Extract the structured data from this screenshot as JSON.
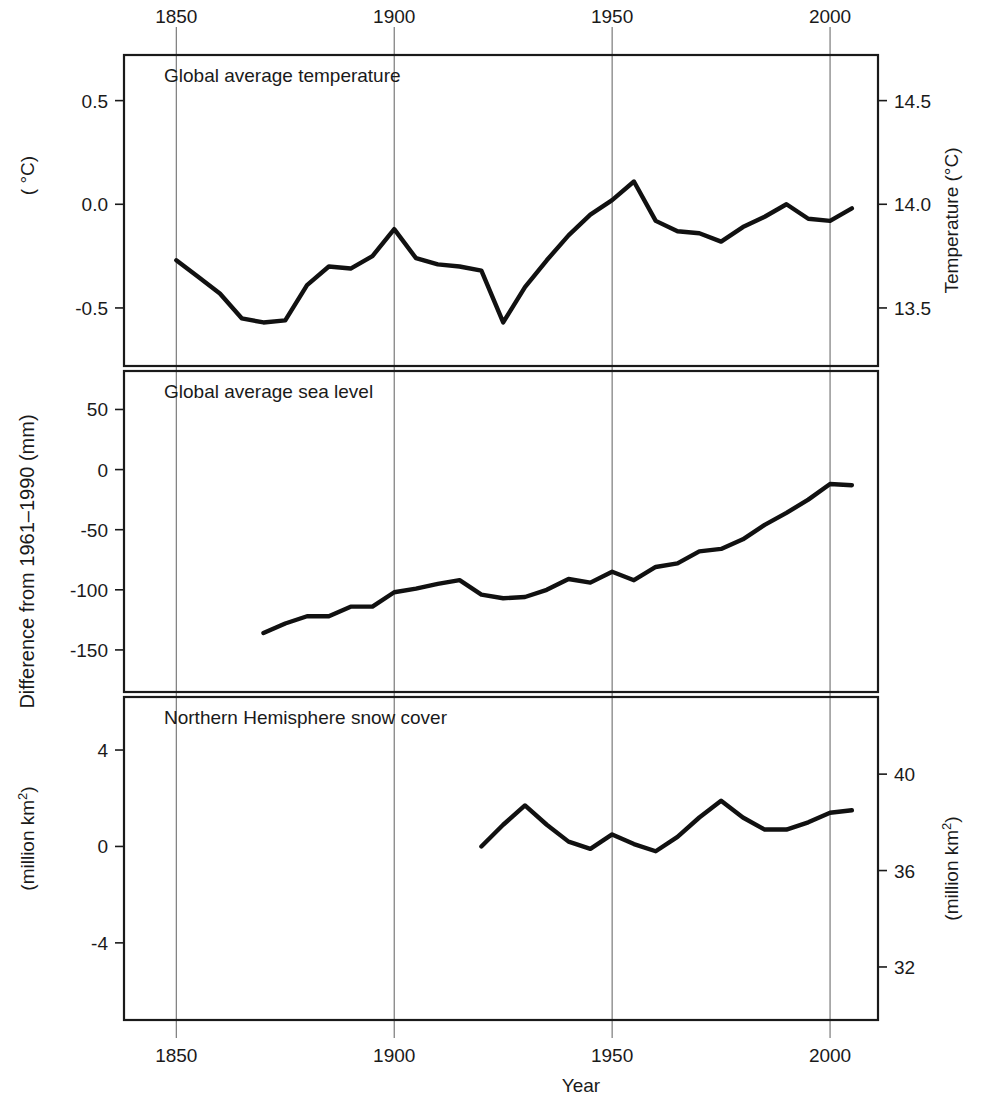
{
  "figure": {
    "xlabel": "Year",
    "x_ticks": [
      1850,
      1900,
      1950,
      2000
    ],
    "x_range": [
      1838,
      2011
    ],
    "left_axis_group_label": "Difference from 1961–1990 (mm)"
  },
  "panels": [
    {
      "id": "temperature",
      "title": "Global average temperature",
      "left_axis_label": "( °C)",
      "left_ticks": [
        "0.5",
        "0.0",
        "-0.5"
      ],
      "left_tick_values": [
        0.5,
        0.0,
        -0.5
      ],
      "right_axis_label": "Temperature  (°C)",
      "right_ticks": [
        "14.5",
        "14.0",
        "13.5"
      ],
      "right_tick_values": [
        0.5,
        0.0,
        -0.5
      ],
      "ylim": [
        -0.78,
        0.72
      ]
    },
    {
      "id": "sea-level",
      "title": "Global average sea level",
      "left_axis_label": "Difference from 1961–1990 (mm)",
      "left_ticks": [
        "50",
        "0",
        "-50",
        "-100",
        "-150"
      ],
      "left_tick_values": [
        50,
        0,
        -50,
        -100,
        -150
      ],
      "right_axis_label": "",
      "right_ticks": [],
      "ylim": [
        -185,
        82
      ]
    },
    {
      "id": "snow-cover",
      "title": "Northern Hemisphere snow cover",
      "left_axis_label": "(million km²)",
      "left_ticks": [
        "4",
        "0",
        "-4"
      ],
      "left_tick_values": [
        4,
        0,
        -4
      ],
      "right_axis_label": "(million km²)",
      "right_ticks": [
        "40",
        "36",
        "32"
      ],
      "right_tick_values": [
        3.0,
        -1.0,
        -5.0
      ],
      "ylim": [
        -7.2,
        6.2
      ]
    }
  ],
  "chart_data": [
    {
      "type": "line",
      "id": "temperature",
      "title": "Global average temperature",
      "xlabel": "Year",
      "ylabel": "( °C)",
      "y2label": "Temperature  (°C)",
      "xlim": [
        1838,
        2011
      ],
      "ylim": [
        -0.78,
        0.72
      ],
      "y2lim": [
        13.22,
        14.72
      ],
      "xticks": [
        1850,
        1900,
        1950,
        2000
      ],
      "yticks": [
        -0.5,
        0.0,
        0.5
      ],
      "y2ticks": [
        13.5,
        14.0,
        14.5
      ],
      "grid": "vertical-only",
      "legend": "none",
      "units": "degrees Celsius anomaly vs 1961-1990",
      "x": [
        1850,
        1855,
        1860,
        1865,
        1870,
        1875,
        1880,
        1885,
        1890,
        1895,
        1900,
        1905,
        1910,
        1915,
        1920,
        1925,
        1930,
        1935,
        1940,
        1945,
        1950,
        1955,
        1960,
        1965,
        1970,
        1975,
        1980,
        1985,
        1990,
        1995,
        2000,
        2005
      ],
      "values": [
        -0.27,
        -0.35,
        -0.43,
        -0.55,
        -0.57,
        -0.56,
        -0.39,
        -0.3,
        -0.31,
        -0.25,
        -0.12,
        -0.26,
        -0.29,
        -0.3,
        -0.32,
        -0.57,
        -0.4,
        -0.27,
        -0.15,
        -0.05,
        0.02,
        0.11,
        -0.08,
        -0.13,
        -0.14,
        -0.18,
        -0.11,
        -0.06,
        0.0,
        -0.07,
        -0.08,
        -0.02,
        0.02,
        0.08,
        0.07,
        0.16,
        0.3,
        0.25,
        0.27,
        0.42,
        0.5,
        0.55
      ]
    },
    {
      "type": "line",
      "id": "sea-level",
      "title": "Global average sea level",
      "xlabel": "Year",
      "ylabel": "Difference from 1961–1990 (mm)",
      "xlim": [
        1838,
        2011
      ],
      "ylim": [
        -185,
        82
      ],
      "xticks": [
        1850,
        1900,
        1950,
        2000
      ],
      "yticks": [
        -150,
        -100,
        -50,
        0,
        50
      ],
      "grid": "vertical-only",
      "legend": "none",
      "units": "millimetres anomaly vs 1961-1990",
      "x": [
        1870,
        1875,
        1880,
        1885,
        1890,
        1895,
        1900,
        1905,
        1910,
        1915,
        1920,
        1925,
        1930,
        1935,
        1940,
        1945,
        1950,
        1955,
        1960,
        1965,
        1970,
        1975,
        1980,
        1985,
        1990,
        1995,
        2000,
        2005
      ],
      "values": [
        -136,
        -128,
        -122,
        -122,
        -114,
        -114,
        -102,
        -99,
        -95,
        -92,
        -104,
        -107,
        -106,
        -100,
        -91,
        -94,
        -85,
        -92,
        -81,
        -78,
        -68,
        -66,
        -58,
        -46,
        -36,
        -25,
        -12,
        -13,
        -5,
        10,
        26,
        26,
        25,
        38,
        50,
        58
      ]
    },
    {
      "type": "line",
      "id": "snow-cover",
      "title": "Northern Hemisphere snow cover",
      "xlabel": "Year",
      "ylabel": "(million km²)",
      "y2label": "(million km²)",
      "xlim": [
        1838,
        2011
      ],
      "ylim": [
        -7.2,
        6.2
      ],
      "y2lim": [
        30.2,
        43.6
      ],
      "xticks": [
        1850,
        1900,
        1950,
        2000
      ],
      "yticks": [
        -4,
        0,
        4
      ],
      "y2ticks": [
        32,
        36,
        40
      ],
      "grid": "vertical-only",
      "legend": "none",
      "units": "million square kilometres anomaly vs 1961-1990",
      "x": [
        1920,
        1925,
        1930,
        1935,
        1940,
        1945,
        1950,
        1955,
        1960,
        1965,
        1970,
        1975,
        1980,
        1985,
        1990,
        1995,
        2000,
        2005
      ],
      "values": [
        0.0,
        0.9,
        1.7,
        0.9,
        0.2,
        -0.1,
        0.5,
        0.1,
        -0.2,
        0.4,
        1.2,
        1.9,
        1.2,
        0.7,
        0.7,
        1.0,
        1.4,
        1.5,
        0.3,
        -1.4,
        -1.9,
        -1.1,
        -0.6,
        -1.0,
        -1.0
      ]
    }
  ]
}
